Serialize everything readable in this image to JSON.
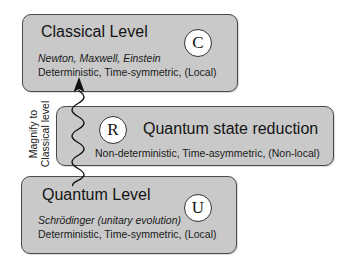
{
  "classical": {
    "title": "Classical Level",
    "names": "Newton, Maxwell, Einstein",
    "properties": "Deterministic,  Time-symmetric,  (Local)",
    "symbol": "C"
  },
  "reduction": {
    "title": "Quantum state reduction",
    "properties": "Non-deterministic,  Time-asymmetric,  (Non-local)",
    "symbol": "R"
  },
  "quantum": {
    "title": "Quantum Level",
    "names": "Schrödinger  (unitary evolution)",
    "properties": "Deterministic,  Time-symmetric,  (Local)",
    "symbol": "U"
  },
  "arrow": {
    "label_line1": "Magnify to",
    "label_line2": "Classical level"
  },
  "colors": {
    "box_fill": "#c9c9c9",
    "box_border": "#4a4a4a",
    "circle_fill": "#ffffff"
  }
}
